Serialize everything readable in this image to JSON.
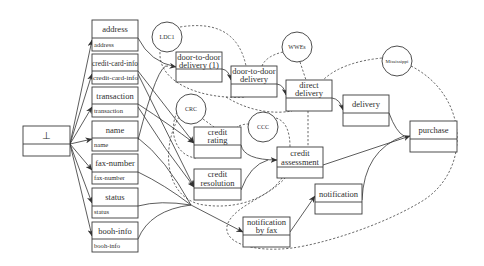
{
  "diagram": {
    "root": {
      "title": "⊥",
      "subtitle": ""
    },
    "attributes": [
      {
        "title": "address",
        "subtitle": "address"
      },
      {
        "title": "credit-card-info",
        "subtitle": "credit-card-info"
      },
      {
        "title": "transaction",
        "subtitle": "transaction"
      },
      {
        "title": "name",
        "subtitle": "name"
      },
      {
        "title": "fax-number",
        "subtitle": "fax-number"
      },
      {
        "title": "status",
        "subtitle": "status"
      },
      {
        "title": "booh-info",
        "subtitle": "booh-info"
      }
    ],
    "activities": {
      "door_to_door_1": {
        "line1": "door-to-door",
        "line2": "delivery (1)"
      },
      "door_to_door": {
        "line1": "door-to-door",
        "line2": "delivery"
      },
      "direct_delivery": {
        "line1": "direct",
        "line2": "delivery"
      },
      "delivery": {
        "line1": "delivery"
      },
      "purchase": {
        "line1": "purchase"
      },
      "credit_rating": {
        "line1": "credit",
        "line2": "rating"
      },
      "credit_resolution": {
        "line1": "credit",
        "line2": "resolution"
      },
      "credit_assessment": {
        "line1": "credit",
        "line2": "assessment"
      },
      "notification_by_fax": {
        "line1": "notification",
        "line2": "by fax"
      },
      "notification": {
        "line1": "notification"
      }
    },
    "services": {
      "ldc1": "LDC1",
      "wwes": "WWEs",
      "crc": "CRC",
      "ccc": "CCC",
      "mississippi": "Mississippi"
    }
  }
}
